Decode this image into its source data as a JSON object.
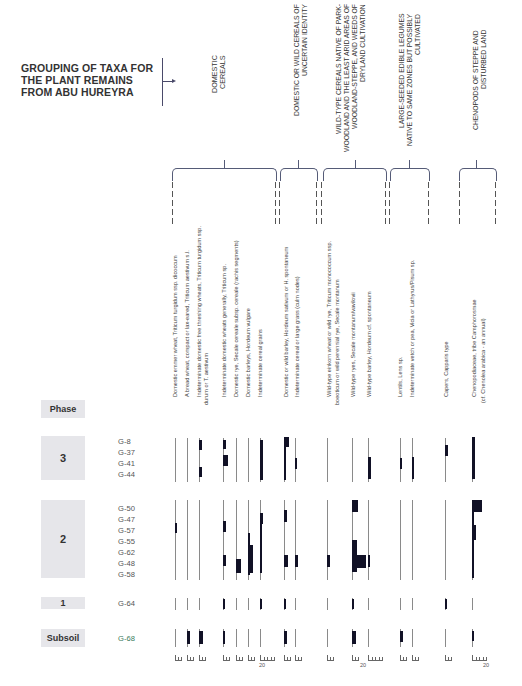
{
  "chart_data": {
    "type": "table",
    "title": "GROUPING OF TAXA FOR THE PLANT REMAINS FROM ABU HUREYRA",
    "subtitle": "",
    "xlabel": "",
    "ylabel": "Phase",
    "legend_position": "none",
    "grid": false,
    "groups": [
      {
        "name": "DOMESTIC CEREALS",
        "taxa_count": 8
      },
      {
        "name": "DOMESTIC OR WILD CEREALS OF UNCERTAIN IDENTITY",
        "taxa_count": 2
      },
      {
        "name": "WILD-TYPE CEREALS NATIVE OF PARK-WOODLAND AND THE LEAST ARID AREAS OF WOODLAND-STEPPE, AND WEEDS OF DRYLAND CULTIVATION",
        "taxa_count": 3
      },
      {
        "name": "LARGE-SEEDED EDIBLE LEGUMES NATIVE TO SAME ZONES BUT POSSIBLY CULTIVATED",
        "taxa_count": 2
      },
      {
        "name": "CAPERS",
        "taxa_count": 1
      },
      {
        "name": "CHENOPODS OF STEPPE AND DISTURBED LAND",
        "taxa_count": 1
      }
    ],
    "categories": [
      "Domestic emmer wheat, Triticum turgidum ssp. dicoccum",
      "A bread wheat, compact or lax-eared, Triticum aestivum s.l.",
      "Indeterminate domestic free threshing wheats, Triticum turgidum ssp. durum or T. aestivum",
      "Indeterminate domestic wheats generally, Triticum sp.",
      "Domestic rye, Secale cereale subsp. cereale (rachis segments)",
      "Domestic barleys, Hordeum vulgare",
      "Indeterminate cereal grains",
      "Domestic or wild barley, Hordeum sativum or H. spontaneum",
      "Indeterminate cereal or large grass (culm nodes)",
      "Wild-type einkorn wheat or wild rye, Triticum monococcum ssp. boeoticum or wild perennial rye, Secale montanum",
      "Wild-type ryes, Secale montanum/vavilovii",
      "Wild-type barley, Hordeum cf. spontaneum",
      "Lentils, Lens sp.",
      "Indeterminate vetch or pea, Vicia or Lathyrus/Pisum sp.",
      "Capers, Capparis type",
      "Chenopodiaceae, tribe Camphorosmae (cf. Chenolea arabica - an annual)"
    ],
    "phases": [
      {
        "phase": "3",
        "samples": [
          "G-8",
          "G-37",
          "G-41",
          "G-44"
        ]
      },
      {
        "phase": "2",
        "samples": [
          "G-50",
          "G-47",
          "G-57",
          "G-55",
          "G-62",
          "G-48",
          "G-58"
        ]
      },
      {
        "phase": "1",
        "samples": [
          "G-64"
        ]
      },
      {
        "phase": "Subsoil",
        "samples": [
          "G-68"
        ]
      }
    ],
    "scale_labels": [
      "20",
      "20",
      "20"
    ],
    "note": "Bar widths represent relative abundance per sample; scale ticks at bottom (5-unit ticks, 20 marked)."
  },
  "title": {
    "line1": "GROUPING OF TAXA FOR",
    "line2": "THE  PLANT REMAINS",
    "line3": "FROM ABU HUREYRA"
  },
  "groups": [
    {
      "label": "DOMESTIC CEREALS"
    },
    {
      "label": "DOMESTIC OR WILD CEREALS OF UNCERTAIN IDENTITY"
    },
    {
      "label": "WILD-TYPE CEREALS NATIVE OF PARK-WOODLAND AND THE LEAST ARID AREAS OF WOODLAND-STEPPE, AND WEEDS OF DRYLAND CULTIVATION"
    },
    {
      "label": "LARGE-SEEDED EDIBLE LEGUMES NATIVE TO SAME ZONES BUT POSSIBLY CULTIVATED"
    },
    {
      "label": "CHENOPODS OF STEPPE AND DISTURBED LAND"
    }
  ],
  "taxa": [
    "Domestic emmer wheat, Triticum turgidum ssp. dicoccum",
    "A bread wheat, compact or lax-eared, Triticum aestivum s.l.",
    "Indeterminate domestic free threshing wheats, Triticum turgidum ssp.",
    "durum or T. aestivum",
    "Indeterminate domestic wheats generally, Triticum sp.",
    "Domestic rye, Secale cereale subsp. cereale (rachis segments)",
    "Domestic barleys, Hordeum vulgare",
    "Indeterminate cereal grains",
    "Domestic or wild barley, Hordeum sativum or H. spontaneum",
    "Indeterminate cereal or large grass (culm nodes)",
    "Wild-type einkorn wheat or wild rye, Triticum monococcum ssp.",
    "boeoticum or wild perennial rye, Secale montanum",
    "Wild-type ryes, Secale montanum/vavilovii",
    "Wild-type barley, Hordeum cf. spontaneum",
    "Lentils, Lens sp.",
    "Indeterminate vetch or pea, Vicia or Lathyrus/Pisum sp.",
    "Capers, Capparis type",
    "Chenopodiaceae, tribe Camphorosmae",
    "(cf. Chenolea arabica - an annual)"
  ],
  "phase_header": "Phase",
  "phases": [
    {
      "label": "3",
      "samples": [
        "G-8",
        "G-37",
        "G-41",
        "G-44"
      ]
    },
    {
      "label": "2",
      "samples": [
        "G-50",
        "G-47",
        "G-57",
        "G-55",
        "G-62",
        "G-48",
        "G-58"
      ]
    },
    {
      "label": "1",
      "samples": [
        "G-64"
      ]
    },
    {
      "label": "Subsoil",
      "samples": [
        "G-68"
      ]
    }
  ],
  "scale_labels": [
    "20",
    "20",
    "20"
  ]
}
